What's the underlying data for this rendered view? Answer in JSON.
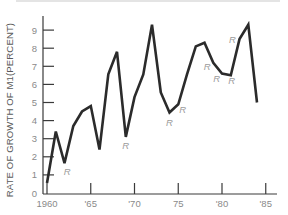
{
  "chart_data": {
    "type": "line",
    "title": "",
    "xlabel": "",
    "ylabel": "RATE OF GROWTH OF M1(PERCENT)",
    "xlim": [
      1960,
      1986
    ],
    "ylim": [
      0,
      9.5
    ],
    "grid": false,
    "legend": null,
    "x_ticks": [
      {
        "value": 1960,
        "label": "1960"
      },
      {
        "value": 1965,
        "label": "'65"
      },
      {
        "value": 1970,
        "label": "'70"
      },
      {
        "value": 1975,
        "label": "75"
      },
      {
        "value": 1980,
        "label": "'80"
      },
      {
        "value": 1985,
        "label": "'85"
      }
    ],
    "y_ticks": [
      0,
      1,
      2,
      3,
      4,
      5,
      6,
      7,
      8,
      9
    ],
    "x": [
      1960,
      1961,
      1962,
      1963,
      1964,
      1965,
      1966,
      1967,
      1968,
      1969,
      1970,
      1971,
      1972,
      1973,
      1974,
      1975,
      1976,
      1977,
      1978,
      1979,
      1980,
      1981,
      1982,
      1983,
      1984
    ],
    "series": [
      {
        "name": "M1 growth rate",
        "values": [
          0.55,
          3.4,
          1.65,
          3.7,
          4.5,
          4.8,
          2.4,
          6.55,
          7.8,
          3.1,
          5.3,
          6.55,
          9.3,
          5.55,
          4.45,
          4.9,
          6.55,
          8.1,
          8.3,
          7.2,
          6.6,
          6.5,
          8.5,
          9.3,
          5.0
        ]
      }
    ],
    "annotations": [
      {
        "text": "R",
        "note": "recession",
        "x": 1962.3,
        "y": 1.2
      },
      {
        "text": "R",
        "note": "recession",
        "x": 1969.0,
        "y": 2.65
      },
      {
        "text": "R",
        "note": "recession",
        "x": 1974.0,
        "y": 3.9
      },
      {
        "text": "R",
        "note": "recession",
        "x": 1975.5,
        "y": 4.6
      },
      {
        "text": "R",
        "note": "recession",
        "x": 1978.3,
        "y": 7.0
      },
      {
        "text": "R",
        "note": "recession",
        "x": 1979.4,
        "y": 6.3
      },
      {
        "text": "R",
        "note": "recession",
        "x": 1981.1,
        "y": 6.2
      },
      {
        "text": "R",
        "note": "recession",
        "x": 1981.2,
        "y": 8.5
      }
    ]
  },
  "axis": {
    "y_label": "RATE OF GROWTH OF M1(PERCENT)",
    "y_tick_labels": [
      "0",
      "1",
      "2",
      "3",
      "4",
      "5",
      "6",
      "7",
      "8",
      "9"
    ],
    "x_tick_labels": [
      "1960",
      "'65",
      "'70",
      "75",
      "'80",
      "'85"
    ]
  },
  "colors": {
    "line": "#2b2b2b",
    "axis": "#3a3a3a",
    "tick_label": "#8a8a8a",
    "annotation": "#9a9a9a",
    "top_rule": "#e4e4e4"
  }
}
